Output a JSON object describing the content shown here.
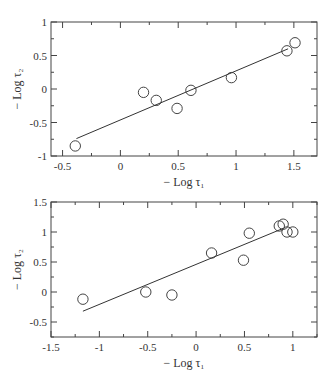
{
  "chart_data": [
    {
      "type": "scatter",
      "title": "",
      "xlabel": "− Log τ₁",
      "ylabel": "− Log τ₂",
      "xlim": [
        -0.6,
        1.7
      ],
      "ylim": [
        -1,
        1
      ],
      "xticks": [
        -0.5,
        0,
        0.5,
        1,
        1.5
      ],
      "xtick_labels": [
        "-0.5",
        "0",
        "0.5",
        "1",
        "1.5"
      ],
      "yticks": [
        -1,
        -0.5,
        0,
        0.5,
        1
      ],
      "ytick_labels": [
        "-1",
        "-0.5",
        "0",
        "0.5",
        "1"
      ],
      "grid": false,
      "legend": null,
      "series": [
        {
          "name": "data",
          "marker": "open-circle",
          "x": [
            -0.39,
            0.2,
            0.31,
            0.49,
            0.61,
            0.96,
            1.44,
            1.51
          ],
          "y": [
            -0.85,
            -0.05,
            -0.17,
            -0.29,
            -0.02,
            0.17,
            0.57,
            0.69
          ]
        },
        {
          "name": "fit",
          "type": "line",
          "x": [
            -0.38,
            1.45
          ],
          "y": [
            -0.74,
            0.6
          ]
        }
      ],
      "frame": {
        "left": 51,
        "top": 22,
        "right": 317,
        "bottom": 156
      }
    },
    {
      "type": "scatter",
      "title": "",
      "xlabel": "− Log τ₁",
      "ylabel": "− Log τ₂",
      "xlim": [
        -1.5,
        1.25
      ],
      "ylim": [
        -0.75,
        1.5
      ],
      "xticks": [
        -1.5,
        -1,
        -0.5,
        0,
        0.5,
        1
      ],
      "xtick_labels": [
        "-1.5",
        "-1",
        "-0.5",
        "0",
        "0.5",
        "1"
      ],
      "yticks": [
        -0.5,
        0,
        0.5,
        1,
        1.5
      ],
      "ytick_labels": [
        "-0.5",
        "0",
        "0.5",
        "1",
        "1.5"
      ],
      "grid": false,
      "legend": null,
      "series": [
        {
          "name": "data",
          "marker": "open-circle",
          "x": [
            -1.17,
            -0.52,
            -0.25,
            0.16,
            0.49,
            0.55,
            0.86,
            0.9,
            0.94,
            1.0
          ],
          "y": [
            -0.12,
            0.0,
            -0.05,
            0.65,
            0.53,
            0.98,
            1.1,
            1.13,
            1.0,
            1.0
          ]
        },
        {
          "name": "fit",
          "type": "line",
          "x": [
            -1.17,
            0.9
          ],
          "y": [
            -0.32,
            1.06
          ]
        }
      ],
      "frame": {
        "left": 51,
        "top": 12,
        "right": 317,
        "bottom": 147
      }
    }
  ]
}
